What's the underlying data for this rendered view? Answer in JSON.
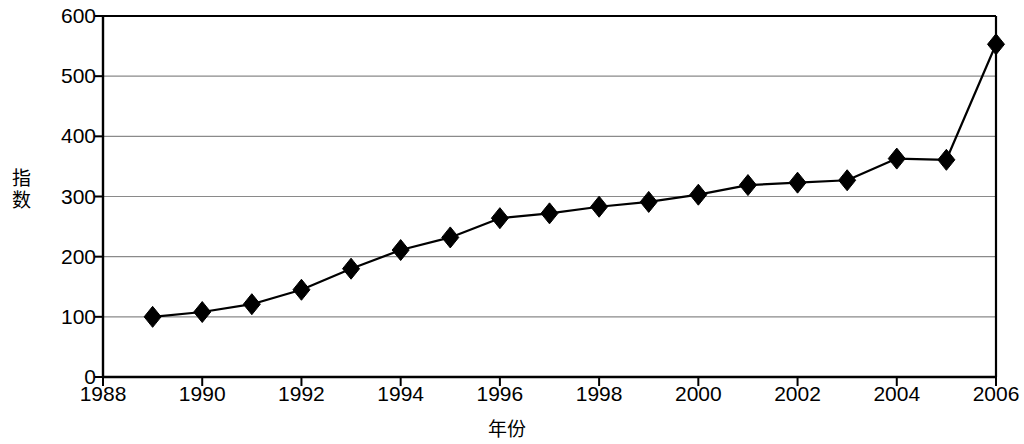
{
  "chart_data": {
    "type": "line",
    "title": "",
    "xlabel": "年份",
    "ylabel": "指数",
    "ylim": [
      0,
      600
    ],
    "xlim": [
      1988,
      2006
    ],
    "ytick_labels": [
      "0",
      "100",
      "200",
      "300",
      "400",
      "500",
      "600"
    ],
    "ytick_values": [
      0,
      100,
      200,
      300,
      400,
      500,
      600
    ],
    "xtick_labels": [
      "1988",
      "1990",
      "1992",
      "1994",
      "1996",
      "1998",
      "2000",
      "2002",
      "2004",
      "2006"
    ],
    "xtick_values": [
      1988,
      1990,
      1992,
      1994,
      1996,
      1998,
      2000,
      2002,
      2004,
      2006
    ],
    "grid": "horizontal",
    "legend": null,
    "marker": "diamond",
    "line_color": "#000000",
    "grid_color": "#8a8a8a",
    "axis_color": "#000000",
    "background_color": "#ffffff",
    "x": [
      1989,
      1990,
      1991,
      1992,
      1993,
      1994,
      1995,
      1996,
      1997,
      1998,
      1999,
      2000,
      2001,
      2002,
      2003,
      2004,
      2005,
      2006
    ],
    "values": [
      100,
      108,
      121,
      145,
      180,
      211,
      232,
      264,
      272,
      283,
      291,
      303,
      319,
      323,
      327,
      363,
      361,
      553
    ],
    "series": [
      {
        "name": "指数",
        "values": [
          100,
          108,
          121,
          145,
          180,
          211,
          232,
          264,
          272,
          283,
          291,
          303,
          319,
          323,
          327,
          363,
          361,
          553
        ]
      }
    ]
  },
  "plot_geometry": {
    "left": 103,
    "right": 996,
    "top": 16,
    "bottom": 377
  }
}
